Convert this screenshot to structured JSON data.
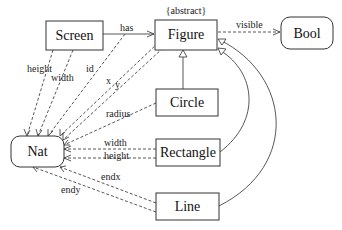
{
  "diagram": {
    "nodes": {
      "screen": "Screen",
      "figure": "Figure",
      "figure_stereotype": "{abstract}",
      "bool": "Bool",
      "circle": "Circle",
      "rectangle": "Rectangle",
      "line": "Line",
      "nat": "Nat"
    },
    "edges": {
      "has": "has",
      "visible": "visible",
      "height_screen": "height",
      "width_screen": "width",
      "id": "id",
      "x": "x",
      "y": "y",
      "radius": "radius",
      "width_rect": "width",
      "height_rect": "height",
      "endx": "endx",
      "endy": "endy"
    },
    "relations": [
      {
        "from": "Screen",
        "to": "Figure",
        "label": "has",
        "kind": "association"
      },
      {
        "from": "Figure",
        "to": "Bool",
        "label": "visible",
        "kind": "dependency"
      },
      {
        "from": "Screen",
        "to": "Nat",
        "label": "height",
        "kind": "dependency"
      },
      {
        "from": "Screen",
        "to": "Nat",
        "label": "width",
        "kind": "dependency"
      },
      {
        "from": "Figure",
        "to": "Nat",
        "label": "id",
        "kind": "dependency"
      },
      {
        "from": "Figure",
        "to": "Nat",
        "label": "x",
        "kind": "dependency"
      },
      {
        "from": "Figure",
        "to": "Nat",
        "label": "y",
        "kind": "dependency"
      },
      {
        "from": "Circle",
        "to": "Nat",
        "label": "radius",
        "kind": "dependency"
      },
      {
        "from": "Rectangle",
        "to": "Nat",
        "label": "width",
        "kind": "dependency"
      },
      {
        "from": "Rectangle",
        "to": "Nat",
        "label": "height",
        "kind": "dependency"
      },
      {
        "from": "Line",
        "to": "Nat",
        "label": "endx",
        "kind": "dependency"
      },
      {
        "from": "Line",
        "to": "Nat",
        "label": "endy",
        "kind": "dependency"
      },
      {
        "from": "Circle",
        "to": "Figure",
        "label": "",
        "kind": "generalization"
      },
      {
        "from": "Rectangle",
        "to": "Figure",
        "label": "",
        "kind": "generalization"
      },
      {
        "from": "Line",
        "to": "Figure",
        "label": "",
        "kind": "generalization"
      }
    ]
  }
}
